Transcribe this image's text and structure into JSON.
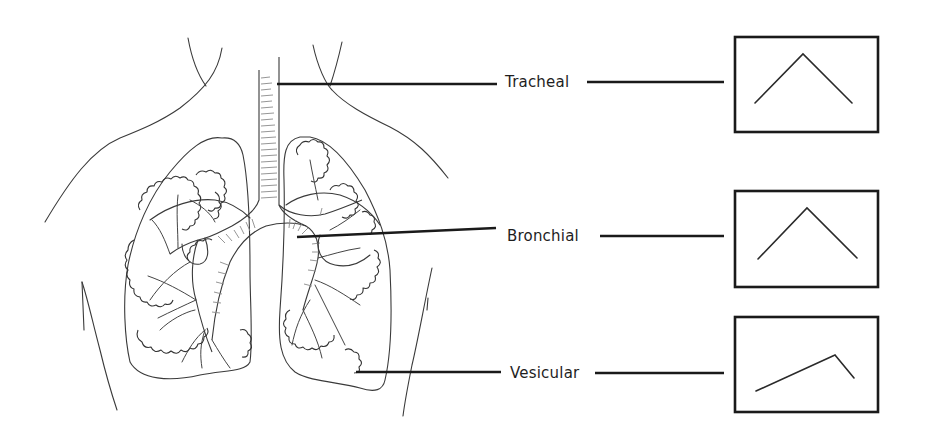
{
  "diagram": {
    "labels": [
      {
        "id": "tracheal",
        "text": "Tracheal",
        "waveform": "symmetric inspiration/expiration peak"
      },
      {
        "id": "bronchial",
        "text": "Bronchial",
        "waveform": "symmetric inspiration/expiration peak"
      },
      {
        "id": "vesicular",
        "text": "Vesicular",
        "waveform": "long inspiration, short expiration"
      }
    ],
    "colors": {
      "background": "#ffffff",
      "line": "#1a1a1a",
      "drawing": "#3a3a3a"
    }
  }
}
